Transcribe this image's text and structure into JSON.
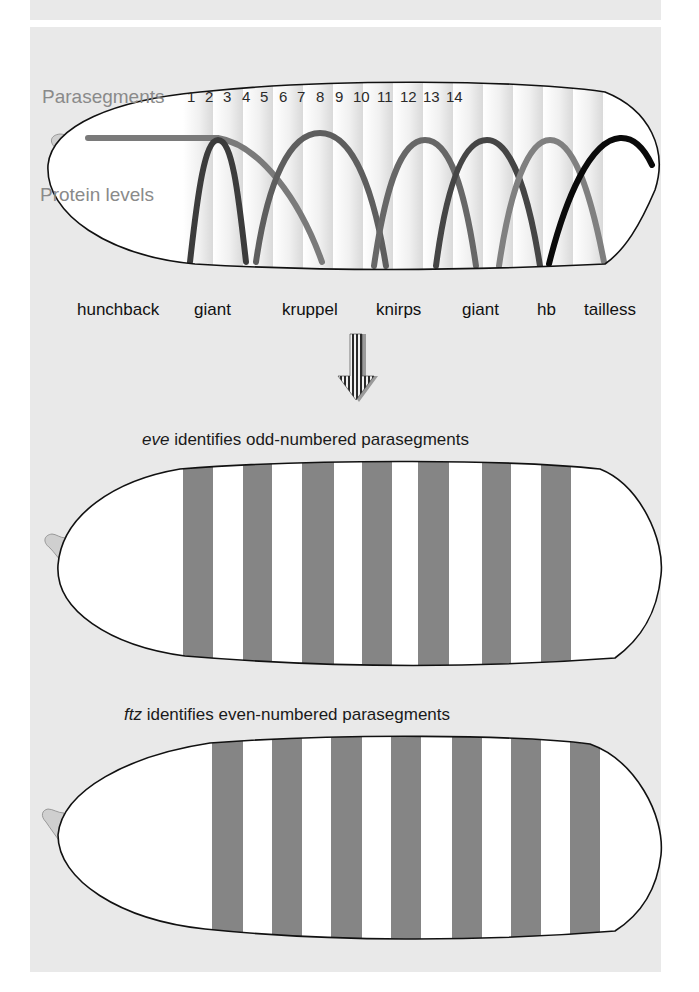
{
  "figure": {
    "top_panel": {
      "axis_labels": {
        "parasegments": "Parasegments",
        "protein_levels": "Protein levels"
      },
      "parasegment_numbers": [
        "1",
        "2",
        "3",
        "4",
        "5",
        "6",
        "7",
        "8",
        "9",
        "10",
        "11",
        "12",
        "13",
        "14"
      ],
      "gap_genes": [
        {
          "label": "hunchback",
          "x": 77
        },
        {
          "label": "giant",
          "x": 194
        },
        {
          "label": "kruppel",
          "x": 282
        },
        {
          "label": "knirps",
          "x": 376
        },
        {
          "label": "giant",
          "x": 462
        },
        {
          "label": "hb",
          "x": 537
        },
        {
          "label": "tailless",
          "x": 584
        }
      ],
      "curves": [
        {
          "gene": "hunchback",
          "color": "#7a7a7a"
        },
        {
          "gene": "giant",
          "color": "#3c3c3c"
        },
        {
          "gene": "kruppel",
          "color": "#5e5e5e"
        },
        {
          "gene": "knirps",
          "color": "#676767"
        },
        {
          "gene": "giant",
          "color": "#454545"
        },
        {
          "gene": "hb",
          "color": "#808080"
        },
        {
          "gene": "tailless",
          "color": "#0a0a0a"
        }
      ]
    },
    "arrow": {
      "direction": "down"
    },
    "eve_panel": {
      "gene": "eve",
      "caption_rest": " identifies odd-numbered parasegments",
      "stripe_count": 7
    },
    "ftz_panel": {
      "gene": "ftz",
      "caption_rest": " identifies even-numbered parasegments",
      "stripe_count": 7
    },
    "colors": {
      "background": "#e9e9e9",
      "stripe": "#858585",
      "embryo_fill": "#ffffff",
      "outline": "#111111",
      "pole_cell": "#cfcfcf"
    }
  }
}
